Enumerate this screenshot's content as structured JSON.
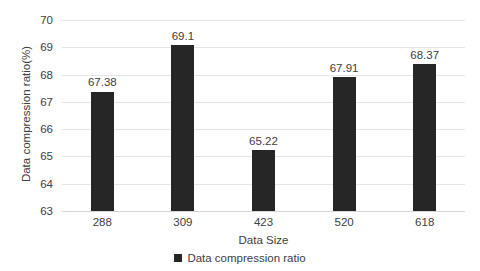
{
  "chart_data": {
    "type": "bar",
    "title": "",
    "categories": [
      "288",
      "309",
      "423",
      "520",
      "618"
    ],
    "values": [
      67.38,
      69.1,
      65.22,
      67.91,
      68.37
    ],
    "data_labels": [
      "67.38",
      "69.1",
      "65.22",
      "67.91",
      "68.37"
    ],
    "series": [
      {
        "name": "Data compression ratio",
        "values": [
          67.38,
          69.1,
          65.22,
          67.91,
          68.37
        ],
        "color": "#262626"
      }
    ],
    "xlabel": "Data Size",
    "ylabel": "Data compression ratio(%)",
    "ylim": [
      63,
      70
    ],
    "ytick_labels": [
      "70",
      "69",
      "68",
      "67",
      "66",
      "65",
      "64",
      "63"
    ],
    "ytick_values": [
      70,
      69,
      68,
      67,
      66,
      65,
      64,
      63
    ],
    "ytick_step": 1,
    "grid": true,
    "grid_color": "#e4e6e8",
    "legend": {
      "position": "bottom-center",
      "entries": [
        {
          "label": "Data compression ratio",
          "color": "#262626"
        }
      ]
    },
    "background_color": "#ffffff",
    "text_color": "#404040"
  }
}
